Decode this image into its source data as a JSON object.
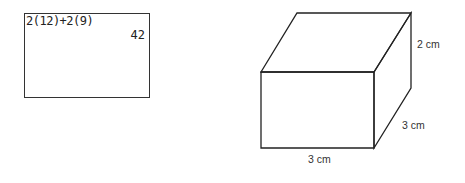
{
  "calculator": {
    "expression": "2(12)+2(9)",
    "result": "42"
  },
  "prism": {
    "height_label": "2 cm",
    "depth_label": "3 cm",
    "width_label": "3 cm",
    "stroke_color": "#222222"
  }
}
